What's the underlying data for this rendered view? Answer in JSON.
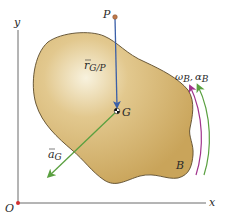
{
  "figure": {
    "type": "rigid-body-kinematics",
    "axes": {
      "x_label": "x",
      "y_label": "y",
      "origin_label": "O"
    },
    "points": {
      "P": {
        "label": "P"
      },
      "G": {
        "label": "G"
      }
    },
    "body": {
      "label": "B"
    },
    "vectors": {
      "r_GP": {
        "label_main": "r",
        "label_sub": "G/P"
      },
      "a_G": {
        "label_main": "a",
        "label_sub": "G"
      }
    },
    "rotation": {
      "omega_main": "ω",
      "omega_sub": "B",
      "sep": ",",
      "alpha_main": "α",
      "alpha_sub": "B"
    },
    "colors": {
      "body_fill": "#d4b36a",
      "body_highlight": "#f6efd8",
      "body_outline": "#5a4a2a",
      "axis": "#6b6b6b",
      "r_vector": "#3a5fa8",
      "a_vector": "#5aa040",
      "omega_arc": "#a0338c",
      "alpha_arc": "#5aa040",
      "point_P": "#c0794a",
      "origin_dot": "#d23030"
    }
  }
}
